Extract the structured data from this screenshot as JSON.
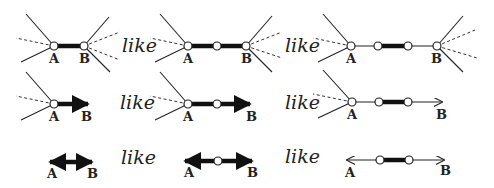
{
  "diagram": {
    "title": "",
    "connector_word": "like",
    "point_labels": {
      "start": "A",
      "end": "B"
    },
    "rows": [
      {
        "name": "segment-row",
        "panels": [
          {
            "type": "segment",
            "label_a": "A",
            "label_b": "B",
            "description": "Short thick segment AB with rays through endpoints"
          },
          {
            "type": "segment",
            "label_a": "A",
            "label_b": "B",
            "description": "Longer thick segment AB with midpoint marked"
          },
          {
            "type": "segment",
            "label_a": "A",
            "label_b": "B",
            "description": "Thin segment AB with thick central portion between two points"
          }
        ],
        "likes": [
          "like",
          "like"
        ]
      },
      {
        "name": "ray-row",
        "panels": [
          {
            "type": "ray",
            "label_a": "A",
            "label_b": "B",
            "description": "Short thick ray from A through B"
          },
          {
            "type": "ray",
            "label_a": "A",
            "label_b": "B",
            "description": "Longer thick ray from A with midpoint"
          },
          {
            "type": "ray",
            "label_a": "A",
            "label_b": "B",
            "description": "Thin ray from A with thick central portion"
          }
        ],
        "likes": [
          "like",
          "like"
        ]
      },
      {
        "name": "line-row",
        "panels": [
          {
            "type": "line",
            "label_a": "A",
            "label_b": "B",
            "description": "Short thick double-arrow line AB"
          },
          {
            "type": "line",
            "label_a": "A",
            "label_b": "B",
            "description": "Longer thick double-arrow line with midpoint"
          },
          {
            "type": "line",
            "label_a": "A",
            "label_b": "B",
            "description": "Thin double-arrow line with thick central portion"
          }
        ],
        "likes": [
          "like",
          "like"
        ]
      }
    ]
  }
}
